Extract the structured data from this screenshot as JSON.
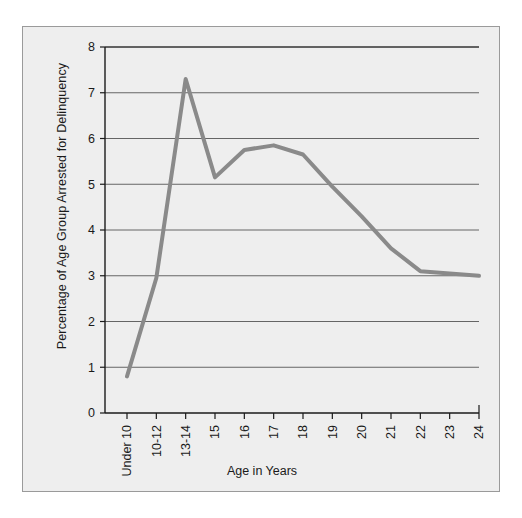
{
  "figure": {
    "background_color": "#eeeeee",
    "border_color": "#9a9a9a"
  },
  "chart_data": {
    "type": "line",
    "title": "",
    "xlabel": "Age in Years",
    "ylabel": "Percentage of Age Group Arrested for Delinquency",
    "categories": [
      "Under 10",
      "10-12",
      "13-14",
      "15",
      "16",
      "17",
      "18",
      "19",
      "20",
      "21",
      "22",
      "23",
      "24"
    ],
    "values": [
      0.8,
      2.95,
      7.3,
      5.15,
      5.75,
      5.85,
      5.65,
      4.95,
      4.3,
      3.6,
      3.1,
      3.05,
      3.0
    ],
    "series": [
      {
        "name": "Percentage of Age Group Arrested for Delinquency",
        "values": [
          0.8,
          2.95,
          7.3,
          5.15,
          5.75,
          5.85,
          5.65,
          4.95,
          4.3,
          3.6,
          3.1,
          3.05,
          3.0
        ],
        "color": "#8a8a8a"
      }
    ],
    "ylim": [
      0,
      8
    ],
    "ytick_labels": [
      "0",
      "1",
      "2",
      "3",
      "4",
      "5",
      "6",
      "7",
      "8"
    ],
    "ytick_values": [
      0,
      1,
      2,
      3,
      4,
      5,
      6,
      7,
      8
    ],
    "grid": true,
    "grid_axis": "y",
    "grid_color": "#555555",
    "legend": false,
    "legend_position": "none",
    "axis_color": "#1a1a1a",
    "line_width": 4
  }
}
